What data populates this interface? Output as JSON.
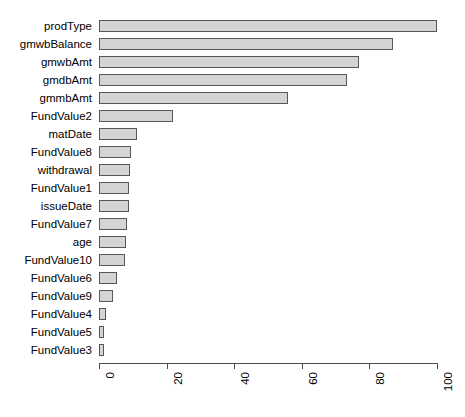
{
  "chart_data": {
    "type": "bar",
    "orientation": "horizontal",
    "title": "",
    "subtitle": "",
    "xlabel": "",
    "ylabel": "",
    "xlim": [
      0,
      100
    ],
    "ylim": null,
    "grid": false,
    "legend": null,
    "legend_position": "none",
    "xticks": [
      "0",
      "20",
      "40",
      "60",
      "80",
      "100"
    ],
    "xtick_values": [
      0,
      20,
      40,
      60,
      80,
      100
    ],
    "categories": [
      "prodType",
      "gmwbBalance",
      "gmwbAmt",
      "gmdbAmt",
      "gmmbAmt",
      "FundValue2",
      "matDate",
      "FundValue8",
      "withdrawal",
      "FundValue1",
      "issueDate",
      "FundValue7",
      "age",
      "FundValue10",
      "FundValue6",
      "FundValue9",
      "FundValue4",
      "FundValue5",
      "FundValue3"
    ],
    "values": [
      100.0,
      87.0,
      77.0,
      73.5,
      56.0,
      21.8,
      11.2,
      9.6,
      9.3,
      9.0,
      8.8,
      8.3,
      8.0,
      7.7,
      5.3,
      4.2,
      2.1,
      1.6,
      1.4
    ],
    "bar_fill_color": "#d4d4d4",
    "bar_border_color": "#575757",
    "axis_color": "#4d4d4d",
    "background_color": "#ffffff"
  }
}
